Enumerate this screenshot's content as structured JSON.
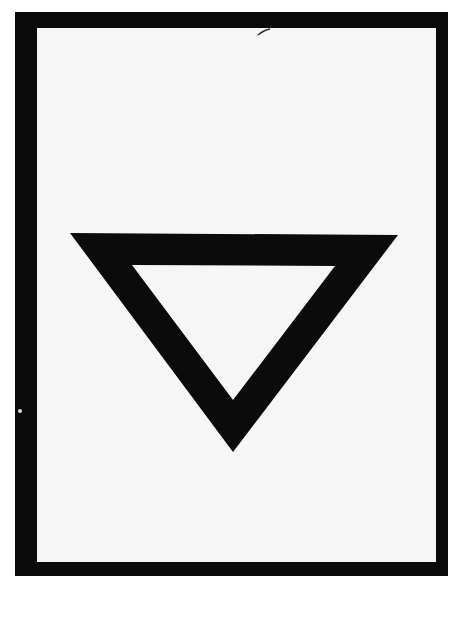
{
  "document": {
    "type": "scanned-placard",
    "symbol": "inverted-triangle-outline",
    "colors": {
      "frame": "#0b0b0b",
      "panel": "#f6f6f6",
      "symbol": "#0b0b0b",
      "background": "#ffffff"
    },
    "text": ""
  }
}
